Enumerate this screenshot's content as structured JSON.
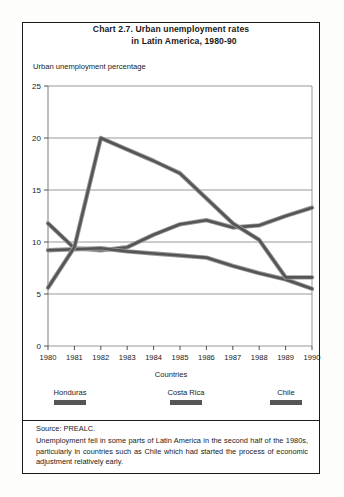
{
  "title": {
    "line1": "Chart 2.7.  Urban unemployment rates",
    "line2": "in Latin America, 1980-90"
  },
  "axis": {
    "y_label": "Urban unemployment percentage",
    "x_label": "Countries"
  },
  "legend": [
    {
      "name": "Honduras",
      "color": "#555555"
    },
    {
      "name": "Costa Rica",
      "color": "#555555"
    },
    {
      "name": "Chile",
      "color": "#555555"
    }
  ],
  "notes": {
    "source": "Source: PREALC.",
    "text": "Unemployment fell in some parts of Latin America in the second half of the 1980s, particularly in countries such as Chile which had started the process of economic adjustment relatively early."
  },
  "chart_data": {
    "type": "line",
    "title": "Chart 2.7.  Urban unemployment rates in Latin America, 1980-90",
    "xlabel": "Countries",
    "ylabel": "Urban unemployment percentage",
    "x": [
      1980,
      1981,
      1982,
      1983,
      1984,
      1985,
      1986,
      1987,
      1988,
      1989,
      1990
    ],
    "categories": [
      "1980",
      "1981",
      "1982",
      "1983",
      "1984",
      "1985",
      "1986",
      "1987",
      "1988",
      "1989",
      "1990"
    ],
    "xlim": [
      1980,
      1990
    ],
    "ylim": [
      0,
      25
    ],
    "yticks": [
      0,
      5,
      10,
      15,
      20,
      25
    ],
    "grid": true,
    "legend_position": "bottom",
    "series": [
      {
        "name": "Honduras",
        "color": "#555555",
        "values": [
          11.8,
          9.4,
          9.2,
          9.5,
          10.7,
          11.7,
          12.1,
          11.4,
          11.6,
          12.5,
          13.3
        ]
      },
      {
        "name": "Costa Rica",
        "color": "#555555",
        "values": [
          9.2,
          9.3,
          9.4,
          9.1,
          8.9,
          8.7,
          8.5,
          7.7,
          7.0,
          6.4,
          5.5
        ]
      },
      {
        "name": "Chile",
        "color": "#555555",
        "values": [
          5.6,
          9.5,
          20.0,
          18.9,
          17.8,
          16.6,
          14.2,
          11.8,
          10.2,
          6.6,
          6.6
        ]
      }
    ]
  }
}
